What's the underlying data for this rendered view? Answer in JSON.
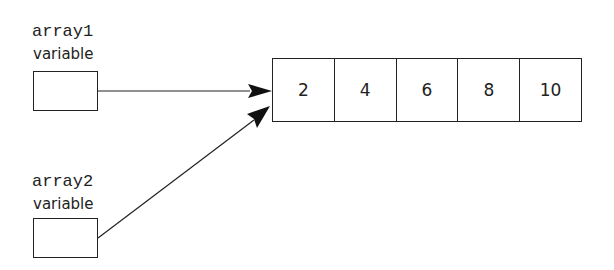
{
  "variables": [
    {
      "name": "array1",
      "label": "variable"
    },
    {
      "name": "array2",
      "label": "variable"
    }
  ],
  "array": {
    "cells": [
      "2",
      "4",
      "6",
      "8",
      "10"
    ]
  },
  "references": [
    {
      "from": "array1",
      "to": "array"
    },
    {
      "from": "array2",
      "to": "array"
    }
  ]
}
